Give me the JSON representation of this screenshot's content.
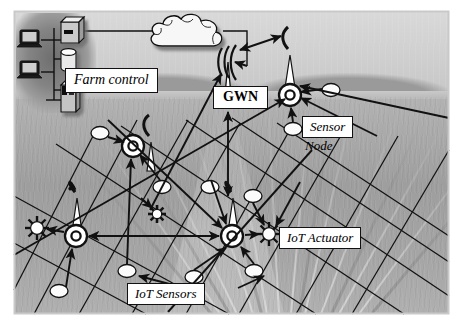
{
  "figure": {
    "kind": "diagram-over-photograph",
    "frame_color": "#c9c9c9",
    "line_color": "#111111",
    "label_box_fill": "#ffffff"
  },
  "labels": {
    "farm_control": "Farm control",
    "gateway": "GWN",
    "sensor": "Sensor",
    "node": "Node",
    "actuator": "IoT Actuator",
    "iot_sensors": "IoT Sensors"
  },
  "icons": {
    "workstation": "computer-monitor-icon",
    "server": "server-box-icon",
    "database": "database-cylinder-icon",
    "tower_pc": "tower-computer-icon",
    "cloud": "cloud-icon",
    "gateway_tower": "antenna-tower-icon",
    "sensor_node": "ring-sensor-node-icon",
    "sensor_mote": "ellipse-sensor-icon",
    "actuator": "starburst-actuator-icon"
  },
  "nodes": {
    "workstations": [
      {
        "name": "workstation-top",
        "x": 27,
        "y": 36
      },
      {
        "name": "workstation-bottom",
        "x": 27,
        "y": 67
      }
    ],
    "server": {
      "x": 67,
      "y": 24
    },
    "database": {
      "x": 67,
      "y": 55
    },
    "tower_pc": {
      "x": 67,
      "y": 86
    },
    "cloud": {
      "x": 152,
      "y": 16,
      "w": 72,
      "h": 42
    },
    "gateway": {
      "x": 228,
      "y": 52
    },
    "sensor_nodes": [
      {
        "name": "sensor-node-right",
        "x": 290,
        "y": 94,
        "has_antenna": true
      },
      {
        "name": "sensor-node-midleft",
        "x": 133,
        "y": 146,
        "has_antenna": true
      },
      {
        "name": "sensor-node-bottomleft",
        "x": 76,
        "y": 236,
        "has_antenna": true
      },
      {
        "name": "sensor-node-bottomcenter",
        "x": 232,
        "y": 236,
        "has_antenna": true
      }
    ],
    "sensor_motes": [
      {
        "x": 100,
        "y": 133
      },
      {
        "x": 162,
        "y": 186
      },
      {
        "x": 210,
        "y": 186
      },
      {
        "x": 127,
        "y": 271
      },
      {
        "x": 194,
        "y": 276
      },
      {
        "x": 254,
        "y": 271
      },
      {
        "x": 293,
        "y": 129
      },
      {
        "x": 330,
        "y": 90
      },
      {
        "x": 59,
        "y": 290
      },
      {
        "x": 253,
        "y": 196
      }
    ],
    "actuators": [
      {
        "name": "actuator-left",
        "x": 37,
        "y": 228
      },
      {
        "name": "actuator-center",
        "x": 157,
        "y": 214,
        "dark": true
      },
      {
        "name": "actuator-right",
        "x": 269,
        "y": 234
      }
    ]
  },
  "links": {
    "description": "Wired backbone from farm control to cloud and gateway; bidirectional wireless links between gateway, sensor nodes and actuators",
    "wired": [
      "workstation-top -> farm-control-bus",
      "workstation-bottom -> farm-control-bus",
      "server -> cloud",
      "cloud -> gateway"
    ],
    "wireless_bidirectional": [
      "gateway <-> sensor-node-right",
      "gateway <-> sensor-node-bottomcenter",
      "sensor-node-bottomleft <-> sensor-node-bottomcenter"
    ],
    "wireless_uplink": [
      "sensor-node-midleft -> gateway",
      "sensor-node-bottomcenter -> gateway",
      "motes -> nearest sensor node",
      "sensor node -> actuator"
    ]
  }
}
